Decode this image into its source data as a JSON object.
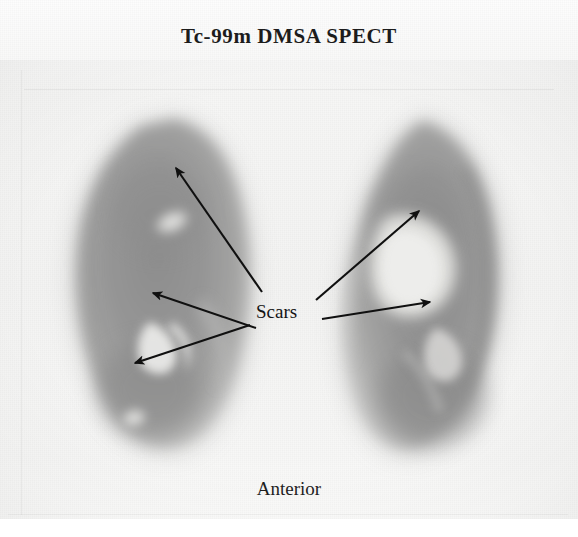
{
  "study": {
    "title": "Tc-99m DMSA SPECT",
    "orientation_label": "Anterior",
    "annotation_label": "Scars"
  },
  "colors": {
    "background": "#f6f6f5",
    "parenchyma_mid": "#9a9a9a",
    "parenchyma_dark": "#7f7f7f",
    "defect_bright": "#e8e8e6",
    "annotation": "#141414",
    "title_text": "#1c1c1c"
  },
  "image": {
    "modality": "SPECT",
    "radiotracer": "Tc-99m DMSA",
    "view": "Anterior",
    "organs": [
      {
        "name": "left-kidney",
        "side": "image-left",
        "top_y": 118,
        "bottom_y": 448
      },
      {
        "name": "right-kidney",
        "side": "image-right",
        "top_y": 122,
        "bottom_y": 452
      }
    ]
  },
  "annotations": {
    "label": "Scars",
    "arrow_count": 5,
    "arrows": [
      {
        "name": "arrow-left-upper-pole",
        "target": "left-kidney-upper-pole",
        "tail_x": 262,
        "tail_y": 292,
        "tip_x": 174,
        "tip_y": 166
      },
      {
        "name": "arrow-left-mid-notch",
        "target": "left-kidney-mid-notch",
        "tail_x": 256,
        "tail_y": 328,
        "tip_x": 151,
        "tip_y": 292
      },
      {
        "name": "arrow-left-lower-pole",
        "target": "left-kidney-lower-pole",
        "tail_x": 250,
        "tail_y": 325,
        "tip_x": 133,
        "tip_y": 362
      },
      {
        "name": "arrow-right-upper-medial",
        "target": "right-kidney-upper-medial",
        "tail_x": 316,
        "tail_y": 300,
        "tip_x": 421,
        "tip_y": 209
      },
      {
        "name": "arrow-right-mid-lateral",
        "target": "right-kidney-mid-lateral",
        "tail_x": 322,
        "tail_y": 319,
        "tip_x": 432,
        "tip_y": 301
      }
    ]
  }
}
